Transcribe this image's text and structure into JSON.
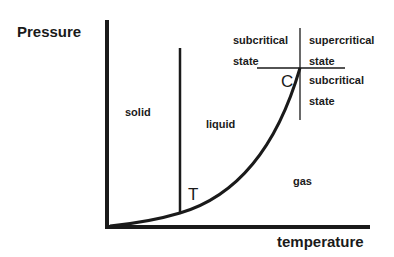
{
  "diagram": {
    "axes": {
      "y_label": "Pressure",
      "x_label": "temperature"
    },
    "regions": {
      "solid": "solid",
      "liquid": "liquid",
      "gas": "gas"
    },
    "points": {
      "triple": "T",
      "critical": "C"
    },
    "critical_quadrants": {
      "upper_left_line1": "subcritical",
      "upper_left_line2": "state",
      "upper_right_line1": "supercritical",
      "upper_right_line2": "state",
      "lower_right_line1": "subcritical",
      "lower_right_line2": "state"
    },
    "colors": {
      "line": "#1a1a1a",
      "background": "#ffffff"
    }
  }
}
